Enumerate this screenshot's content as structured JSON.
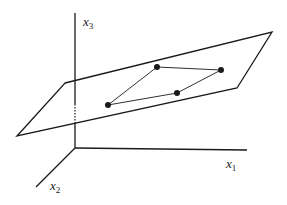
{
  "diagram": {
    "title": "",
    "colors": {
      "stroke": "#1a1a1a",
      "background": "#ffffff"
    },
    "axes": {
      "origin": [
        75,
        148
      ],
      "x1": {
        "label": "x",
        "subscript": "1",
        "end": [
          247,
          150
        ],
        "label_pos": [
          226,
          168
        ]
      },
      "x2": {
        "label": "x",
        "subscript": "2",
        "end": [
          36,
          187
        ],
        "label_pos": [
          50,
          190
        ]
      },
      "x3": {
        "label": "x",
        "subscript": "3",
        "end": [
          75,
          13
        ],
        "label_pos": [
          83,
          26
        ]
      },
      "x3_hidden_segment": {
        "from": [
          75,
          104
        ],
        "to": [
          75,
          124
        ],
        "style": "dotted"
      }
    },
    "plane": {
      "vertices": [
        [
          65,
          83
        ],
        [
          272,
          32
        ],
        [
          237,
          88
        ],
        [
          17,
          136
        ]
      ]
    },
    "polygon_on_plane": {
      "points": [
        [
          157,
          67
        ],
        [
          221,
          70
        ],
        [
          177,
          93
        ],
        [
          108,
          105
        ]
      ],
      "point_radius": 3
    }
  }
}
